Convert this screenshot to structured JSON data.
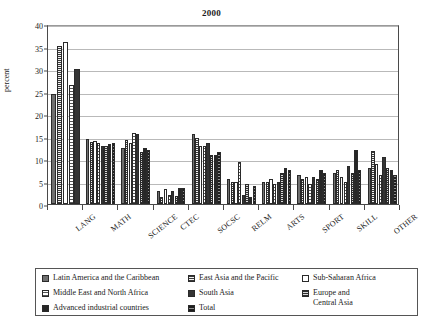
{
  "chart_data": {
    "type": "bar",
    "title": "2000",
    "xlabel": "",
    "ylabel": "percent",
    "ylim": [
      0,
      40
    ],
    "yticks": [
      0,
      5,
      10,
      15,
      20,
      25,
      30,
      35,
      40
    ],
    "grid": true,
    "legend_position": "below",
    "categories": [
      "LANG",
      "MATH",
      "SCIENCE",
      "CTEC",
      "SOCSC",
      "RELM",
      "ARTS",
      "SPORT",
      "SKILL",
      "OTHER"
    ],
    "series": [
      {
        "name": "Latin America and the Caribbean",
        "values": [
          24.5,
          14.5,
          12.5,
          2.8,
          15.5,
          5.5,
          5.0,
          6.5,
          7.0,
          8.0
        ]
      },
      {
        "name": "East Asia and the Pacific",
        "values": [
          35.2,
          13.8,
          14.3,
          1.5,
          14.7,
          5.0,
          5.0,
          5.5,
          7.5,
          11.8
        ]
      },
      {
        "name": "Sub-Saharan Africa",
        "values": [
          36.0,
          14.0,
          13.5,
          3.3,
          13.0,
          4.8,
          5.5,
          6.0,
          6.0,
          9.0
        ]
      },
      {
        "name": "Middle East and North Africa",
        "values": [
          26.5,
          13.5,
          15.8,
          2.0,
          13.0,
          9.3,
          4.5,
          4.5,
          5.0,
          6.5
        ]
      },
      {
        "name": "South Asia",
        "values": [
          30.0,
          13.0,
          15.5,
          3.0,
          13.5,
          2.0,
          5.0,
          6.0,
          8.5,
          10.5
        ]
      },
      {
        "name": "Europe and\nCentral Asia",
        "values": [
          null,
          13.0,
          11.5,
          1.8,
          11.0,
          4.5,
          7.0,
          5.5,
          6.8,
          8.0
        ]
      },
      {
        "name": "Advanced industrial countries",
        "values": [
          null,
          13.3,
          12.5,
          3.5,
          11.0,
          1.5,
          8.0,
          7.5,
          12.0,
          7.5
        ]
      },
      {
        "name": "Total",
        "values": [
          null,
          13.5,
          12.0,
          3.5,
          11.5,
          4.0,
          7.5,
          7.0,
          7.5,
          6.5
        ]
      }
    ]
  },
  "legend": {
    "columns": [
      [
        {
          "name": "Latin America and the Caribbean",
          "series": 0
        },
        {
          "name": "Middle East and North Africa",
          "series": 3
        },
        {
          "name": "Advanced industrial countries",
          "series": 6
        }
      ],
      [
        {
          "name": "East Asia and the Pacific",
          "series": 1
        },
        {
          "name": "South Asia",
          "series": 4
        },
        {
          "name": "Total",
          "series": 7
        }
      ],
      [
        {
          "name": "Sub-Saharan Africa",
          "series": 2
        },
        {
          "name": "Europe and\nCentral Asia",
          "series": 5
        }
      ]
    ]
  }
}
